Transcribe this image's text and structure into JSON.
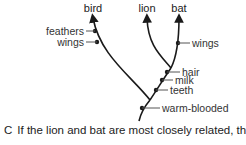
{
  "diagram": {
    "type": "cladogram",
    "taxa": [
      {
        "name": "bird"
      },
      {
        "name": "lion"
      },
      {
        "name": "bat"
      }
    ],
    "traits": [
      {
        "label": "feathers",
        "branch": "bird"
      },
      {
        "label": "wings",
        "branch": "bird"
      },
      {
        "label": "wings",
        "branch": "bat"
      },
      {
        "label": "hair",
        "branch": "mammal-stem"
      },
      {
        "label": "milk",
        "branch": "mammal-stem"
      },
      {
        "label": "teeth",
        "branch": "mammal-stem"
      },
      {
        "label": "warm-blooded",
        "branch": "root"
      }
    ],
    "colors": {
      "line": "#1a1a1a",
      "text": "#333333",
      "tick": "#555555"
    }
  },
  "caption": {
    "letter": "C",
    "text": "If the lion and bat are most closely related, the derived"
  }
}
